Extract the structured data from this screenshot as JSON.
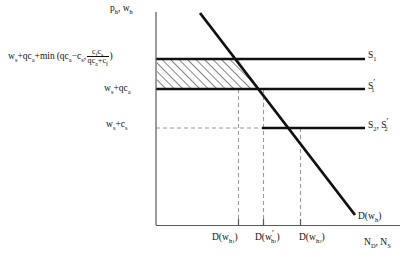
{
  "figure": {
    "type": "economics-supply-demand-diagram",
    "axes": {
      "y_label": "p_h, w_h",
      "x_label": "N_D, N_S",
      "y_axis_x": 156,
      "x_axis_y": 225,
      "y_axis_top": 12,
      "x_axis_right": 400
    },
    "y_axis_value_labels": [
      {
        "name": "s1-level",
        "text": "w_s+qc_a+min(qc_a−c_s, c_f c_s / (qc_a+c_f))",
        "y": 59
      },
      {
        "name": "s1prime-level",
        "text": "w_s+qc_a",
        "y": 89
      },
      {
        "name": "s2-level",
        "text": "w_s+c_s",
        "y": 128
      }
    ],
    "supply_lines": [
      {
        "name": "S1",
        "label": "S₁",
        "y": 59,
        "x_start": 156,
        "x_end": 365,
        "style": "solid"
      },
      {
        "name": "S1prime",
        "label": "S₁′",
        "y": 89,
        "x_start": 156,
        "x_end": 365,
        "style": "solid"
      },
      {
        "name": "S2_S2prime",
        "label": "S₂, S₂′",
        "y": 128,
        "x_start": 262,
        "x_end": 365,
        "style": "solid"
      }
    ],
    "demand_curve": {
      "name": "demand",
      "label": "D(w_h)",
      "x1": 200,
      "y1": 13,
      "x2": 355,
      "y2": 215
    },
    "hatched_region": {
      "name": "surplus-area",
      "description": "region bounded by y-axis, S1 above, S1' below, demand curve on the right",
      "left": 156,
      "top": 59,
      "bottom": 89,
      "top_right_x": 238,
      "bottom_right_x": 262
    },
    "tick_marks": [
      {
        "name": "tick-1",
        "x": 238,
        "label": "D(w_h₁)"
      },
      {
        "name": "tick-2",
        "x": 263,
        "label": "D(w′_h₁)"
      },
      {
        "name": "tick-3",
        "x": 300,
        "label": "D(w_h₂)"
      }
    ],
    "dashed_guides": [
      {
        "name": "vline-1",
        "x": 238,
        "y_top": 89,
        "y_bottom": 225
      },
      {
        "name": "vline-2",
        "x": 263,
        "y_top": 89,
        "y_bottom": 225
      },
      {
        "name": "vline-3",
        "x": 300,
        "y_top": 128,
        "y_bottom": 225
      },
      {
        "name": "hline-s2",
        "y": 128,
        "x_start": 156,
        "x_end": 262
      }
    ],
    "text": {
      "y_axis": {
        "p": "p",
        "ph_sub": "h",
        "w": "w",
        "wh_sub": "h"
      },
      "s1_value": {
        "prefix": "w",
        "prefix_sub": "s",
        "plus1": "+qc",
        "plus1_sub": "a",
        "plus2": "+min (qc",
        "plus2_sub": "a",
        "minus": "−c",
        "minus_sub": "s",
        "comma": ",",
        "frac_num_a": "c",
        "frac_num_a_sub": "f",
        "frac_num_b": "c",
        "frac_num_b_sub": "s",
        "frac_den_a": "qc",
        "frac_den_a_sub": "a",
        "frac_den_b": "+c",
        "frac_den_b_sub": "f",
        "close": ")"
      },
      "s1prime_value": {
        "a": "w",
        "a_sub": "s",
        "b": "+qc",
        "b_sub": "a"
      },
      "s2_value": {
        "a": "w",
        "a_sub": "s",
        "b": "+c",
        "b_sub": "s"
      },
      "s1_label": {
        "base": "S",
        "sub": "1"
      },
      "s1prime_label": {
        "base": "S",
        "sub": "1",
        "prime": "′"
      },
      "s2_label": {
        "base1": "S",
        "sub1": "2",
        "sep": ", ",
        "base2": "S",
        "sub2": "2",
        "prime": "′"
      },
      "demand_label": {
        "d": "D(w",
        "sub": "h",
        "close": ")"
      },
      "x_axis_label": {
        "n1": "N",
        "sub1": "D",
        "sep": ", ",
        "n2": "N",
        "sub2": "S"
      },
      "tick1": {
        "d": "D(w",
        "sub": "h",
        "subsub": "1",
        "close": ")"
      },
      "tick2": {
        "d": "D(w",
        "prime": "′",
        "sub": "h",
        "subsub": "1",
        "close": ")"
      },
      "tick3": {
        "d": "D(w",
        "sub": "h",
        "subsub": "2",
        "close": ")"
      }
    },
    "colors": {
      "ink": "#111111",
      "axis": "#555555",
      "dashed": "#999999",
      "background": "#ffffff"
    }
  }
}
